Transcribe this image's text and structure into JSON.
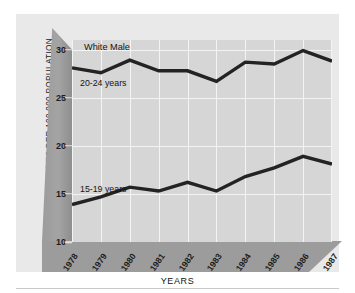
{
  "chart_data": {
    "type": "line",
    "title": "White Male",
    "xlabel": "YEARS",
    "ylabel": "SUICIDES PER 100,000 POPULATION",
    "categories": [
      "1978",
      "1979",
      "1980",
      "1981",
      "1982",
      "1983",
      "1984",
      "1985",
      "1986",
      "1987"
    ],
    "ylim": [
      10,
      31
    ],
    "yticks": [
      30,
      25,
      20,
      15,
      10
    ],
    "grid": true,
    "legend_position": "inline-annotation",
    "series": [
      {
        "name": "20-24 years",
        "values": [
          28.1,
          27.6,
          28.9,
          27.8,
          27.8,
          26.7,
          28.7,
          28.5,
          29.9,
          28.8
        ]
      },
      {
        "name": "15-19 years",
        "values": [
          13.9,
          14.7,
          15.7,
          15.3,
          16.2,
          15.3,
          16.8,
          17.7,
          18.9,
          18.1
        ]
      }
    ],
    "colors": {
      "line": "#232323",
      "plot_background": "#d6d6d6",
      "gridline": "#f4f4f4",
      "wall": "#9c9c9c",
      "panel": "#e9e9e9"
    }
  }
}
